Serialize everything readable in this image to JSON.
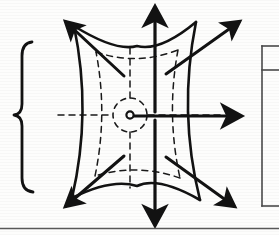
{
  "figure": {
    "kind": "hand-drawn-technical-diagram",
    "title": "",
    "ink_color": "#121212",
    "paper_color": "#fdfdfc",
    "dash_color": "#1a1a1a"
  },
  "origin": {
    "label": "o",
    "x": 130,
    "y": 115,
    "marker": "small-open-circle"
  },
  "arrows": [
    {
      "name": "arrow-up",
      "direction": "up",
      "from_x": 155,
      "from_y": 112,
      "to_x": 155,
      "to_y": 4,
      "style": "solid"
    },
    {
      "name": "arrow-down",
      "direction": "down",
      "from_x": 155,
      "from_y": 120,
      "to_x": 155,
      "to_y": 228,
      "style": "solid"
    },
    {
      "name": "arrow-right",
      "direction": "right",
      "from_x": 134,
      "from_y": 116,
      "to_x": 244,
      "to_y": 116,
      "style": "solid"
    },
    {
      "name": "arrow-up-left",
      "direction": "up-left",
      "from_x": 124,
      "from_y": 76,
      "to_x": 62,
      "to_y": 18,
      "style": "solid"
    },
    {
      "name": "arrow-up-right",
      "direction": "up-right",
      "from_x": 166,
      "from_y": 74,
      "to_x": 243,
      "to_y": 18,
      "style": "solid"
    },
    {
      "name": "arrow-down-left",
      "direction": "down-left",
      "from_x": 124,
      "from_y": 156,
      "to_x": 62,
      "to_y": 210,
      "style": "solid"
    },
    {
      "name": "arrow-down-right",
      "direction": "down-right",
      "from_x": 166,
      "from_y": 157,
      "to_x": 238,
      "to_y": 210,
      "style": "solid"
    }
  ],
  "axes": {
    "vertical_dashed": {
      "name": "dashed-vertical-axis",
      "x": 130,
      "y1": 48,
      "y2": 188
    },
    "horizontal_dashed": {
      "name": "dashed-horizontal-axis",
      "y": 115,
      "x1": 58,
      "x2": 222
    },
    "origin_circle": {
      "name": "dashed-origin-circle",
      "cx": 130,
      "cy": 115,
      "r": 17
    }
  },
  "outline": {
    "name": "solid-curved-quadrilateral",
    "corners": [
      {
        "name": "top-left",
        "x": 74,
        "y": 26
      },
      {
        "name": "top-right",
        "x": 196,
        "y": 22
      },
      {
        "name": "bottom-right",
        "x": 200,
        "y": 200
      },
      {
        "name": "bottom-left",
        "x": 72,
        "y": 198
      }
    ],
    "side_curvature": "concave"
  },
  "inner_outline": {
    "name": "dashed-inner-quadrilateral",
    "corners": [
      {
        "name": "top-left",
        "x": 96,
        "y": 52
      },
      {
        "name": "top-right",
        "x": 178,
        "y": 50
      },
      {
        "name": "bottom-right",
        "x": 180,
        "y": 178
      },
      {
        "name": "bottom-left",
        "x": 95,
        "y": 176
      }
    ],
    "side_curvature": "concave"
  },
  "left_brace": {
    "name": "curly-brace",
    "glyph": "{",
    "x": 22,
    "y_top": 42,
    "y_bottom": 192
  },
  "right_table": {
    "name": "cropped-table",
    "visible": true,
    "left_edge_x": 262,
    "top_y": 46,
    "bottom_y": 206,
    "row_divider_y": 70,
    "cropped": true,
    "cells": []
  },
  "bottom_rule": {
    "name": "horizontal-rule",
    "y": 228,
    "x1": 0,
    "x2": 279
  }
}
